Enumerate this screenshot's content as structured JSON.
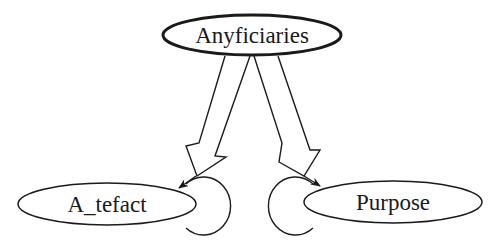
{
  "diagram": {
    "type": "directed-graph",
    "background": "#ffffff",
    "stroke_color": "#1a1a1a",
    "nodes": [
      {
        "id": "anyficiaries",
        "label": "Anyficiaries",
        "shape": "ellipse",
        "border": "bold"
      },
      {
        "id": "artefact",
        "label": "A_tefact",
        "shape": "ellipse",
        "border": "normal"
      },
      {
        "id": "purpose",
        "label": "Purpose",
        "shape": "ellipse",
        "border": "normal"
      }
    ],
    "edges": [
      {
        "from": "anyficiaries",
        "to": "artefact",
        "style": "hollow-fat-arrow"
      },
      {
        "from": "anyficiaries",
        "to": "purpose",
        "style": "hollow-fat-arrow"
      },
      {
        "from": "artefact",
        "to": "artefact",
        "style": "self-loop"
      },
      {
        "from": "purpose",
        "to": "purpose",
        "style": "self-loop"
      }
    ]
  }
}
